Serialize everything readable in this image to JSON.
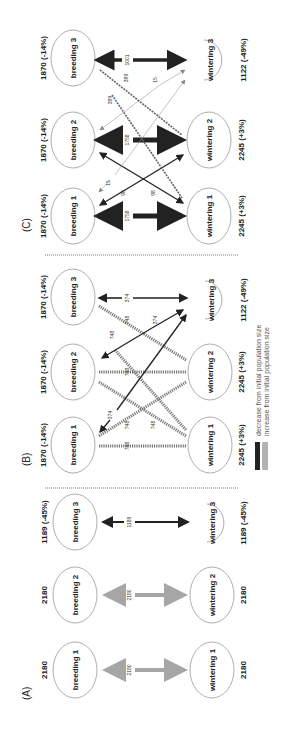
{
  "figure": {
    "panels": [
      {
        "id": "A",
        "label": "(A)",
        "breeding": [
          {
            "name": "breeding 1",
            "population": "2180"
          },
          {
            "name": "breeding 2",
            "population": "2180"
          },
          {
            "name": "breeding 3",
            "population": "1189 (-45%)"
          }
        ],
        "wintering": [
          {
            "name": "wintering 1",
            "population": "2180"
          },
          {
            "name": "wintering 2",
            "population": "2180"
          },
          {
            "name": "wintering 3",
            "population": "1189 (-45%)"
          }
        ],
        "flows": [
          {
            "from": "breeding 1",
            "to": "wintering 1",
            "value": "2180",
            "style": "gray"
          },
          {
            "from": "breeding 2",
            "to": "wintering 2",
            "value": "2180",
            "style": "gray"
          },
          {
            "from": "breeding 3",
            "to": "wintering 3",
            "value": "1189",
            "style": "decrease"
          }
        ]
      },
      {
        "id": "B",
        "label": "(B)",
        "breeding": [
          {
            "name": "breeding 1",
            "population": "1870 (-14%)"
          },
          {
            "name": "breeding 2",
            "population": "1870 (-14%)"
          },
          {
            "name": "breeding 3",
            "population": "1870 (-14%)"
          }
        ],
        "wintering": [
          {
            "name": "wintering 1",
            "population": "2245 (+3%)"
          },
          {
            "name": "wintering 2",
            "population": "2245 (+3%)"
          },
          {
            "name": "wintering 3",
            "population": "1122 (-49%)"
          }
        ],
        "flows": [
          {
            "from": "breeding 1",
            "to": "wintering 1",
            "value": "748",
            "style": "increase"
          },
          {
            "from": "breeding 2",
            "to": "wintering 2",
            "value": "748",
            "style": "increase"
          },
          {
            "from": "breeding 3",
            "to": "wintering 3",
            "value": "374",
            "style": "decrease"
          },
          {
            "from": "breeding 1",
            "to": "wintering 2",
            "value": "748",
            "style": "increase"
          },
          {
            "from": "breeding 2",
            "to": "wintering 1",
            "value": "748",
            "style": "increase"
          },
          {
            "from": "breeding 2",
            "to": "wintering 3",
            "value": "748",
            "style": "increase"
          },
          {
            "from": "breeding 3",
            "to": "wintering 2",
            "value": "748",
            "style": "increase"
          },
          {
            "from": "breeding 1",
            "to": "wintering 3",
            "value": "374",
            "style": "decrease"
          },
          {
            "from": "breeding 2",
            "to": "wintering 3",
            "value": "374",
            "style": "decrease"
          }
        ]
      },
      {
        "id": "C",
        "label": "(C)",
        "breeding": [
          {
            "name": "breeding 1",
            "population": "1870 (-14%)"
          },
          {
            "name": "breeding 2",
            "population": "1870 (-14%)"
          },
          {
            "name": "breeding 3",
            "population": "1870 (-14%)"
          }
        ],
        "wintering": [
          {
            "name": "wintering 1",
            "population": "2245 (+3%)"
          },
          {
            "name": "wintering 2",
            "population": "2245 (+3%)"
          },
          {
            "name": "wintering 3",
            "population": "1122 (-49%)"
          }
        ],
        "flows": [
          {
            "from": "breeding 1",
            "to": "wintering 1",
            "value": "1758",
            "style": "decrease"
          },
          {
            "from": "breeding 2",
            "to": "wintering 2",
            "value": "1758",
            "style": "decrease"
          },
          {
            "from": "breeding 3",
            "to": "wintering 3",
            "value": "1001",
            "style": "decrease"
          },
          {
            "from": "breeding 1",
            "to": "wintering 2",
            "value": "98",
            "style": "decrease"
          },
          {
            "from": "breeding 2",
            "to": "wintering 1",
            "value": "98",
            "style": "decrease"
          },
          {
            "from": "breeding 1",
            "to": "wintering 3",
            "value": "15",
            "style": "thin"
          },
          {
            "from": "breeding 2",
            "to": "wintering 3",
            "value": "15",
            "style": "thin"
          },
          {
            "from": "breeding 3",
            "to": "wintering 1",
            "value": "389",
            "style": "increase"
          },
          {
            "from": "breeding 3",
            "to": "wintering 2",
            "value": "389",
            "style": "increase"
          }
        ]
      }
    ],
    "legend": {
      "decrease": "decrease from initial population size",
      "increase": "increase from initial population size"
    },
    "colors": {
      "decrease": "#222222",
      "increase": "#777777",
      "neutral": "#a6a6a6",
      "node_stroke": "#999999"
    }
  }
}
